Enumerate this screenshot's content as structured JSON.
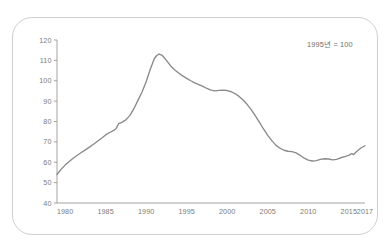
{
  "chart_data": {
    "type": "line",
    "title": "",
    "subtitle": "",
    "note": "1995년 = 100",
    "xlabel": "",
    "ylabel": "",
    "xlim": [
      1979,
      2017
    ],
    "ylim": [
      40,
      120
    ],
    "grid": false,
    "legend": null,
    "line_color": "#8a8a8a",
    "axis_color": "#9a9a9a",
    "frame_color": "#cfcfcf",
    "background_color": "#ffffff",
    "y_ticks": [
      40,
      50,
      60,
      70,
      80,
      90,
      100,
      110,
      120
    ],
    "y_tick_labels": [
      "40",
      "50",
      "60",
      "70",
      "80",
      "90",
      "100",
      "110",
      "120"
    ],
    "x_ticks": [
      1980,
      1985,
      1990,
      1995,
      2000,
      2005,
      2010,
      2015,
      2017
    ],
    "x_tick_labels": [
      "1980",
      "1985",
      "1990",
      "1995",
      "2000",
      "2005",
      "2010",
      "2015",
      "2017"
    ],
    "series": [
      {
        "name": "index",
        "x": [
          1979,
          1979.5,
          1980,
          1980.5,
          1981,
          1981.5,
          1982,
          1982.5,
          1983,
          1983.5,
          1984,
          1984.5,
          1985,
          1985.5,
          1986,
          1986.3,
          1986.6,
          1987,
          1987.5,
          1988,
          1988.5,
          1989,
          1989.5,
          1990,
          1990.5,
          1991,
          1991.3,
          1991.6,
          1992,
          1992.5,
          1993,
          1993.5,
          1994,
          1994.5,
          1995,
          1995.5,
          1996,
          1996.5,
          1997,
          1997.5,
          1998,
          1998.5,
          1999,
          1999.5,
          2000,
          2000.5,
          2001,
          2001.5,
          2002,
          2002.5,
          2003,
          2003.5,
          2004,
          2004.5,
          2005,
          2005.5,
          2006,
          2006.5,
          2007,
          2007.5,
          2008,
          2008.5,
          2009,
          2009.5,
          2010,
          2010.5,
          2011,
          2011.5,
          2012,
          2012.5,
          2013,
          2013.5,
          2014,
          2014.5,
          2015,
          2015.3,
          2015.6,
          2016,
          2016.5,
          2017
        ],
        "y": [
          54.0,
          56.5,
          58.6,
          60.4,
          62.0,
          63.4,
          64.8,
          66.1,
          67.4,
          68.8,
          70.3,
          71.8,
          73.4,
          74.6,
          75.6,
          76.6,
          78.9,
          79.6,
          80.8,
          83.0,
          86.4,
          90.5,
          94.6,
          99.5,
          105.5,
          110.8,
          112.4,
          113.1,
          112.4,
          110.0,
          107.4,
          105.4,
          103.8,
          102.4,
          101.2,
          100.0,
          99.0,
          98.1,
          97.2,
          96.2,
          95.4,
          95.0,
          95.3,
          95.4,
          95.2,
          94.6,
          93.6,
          92.2,
          90.4,
          88.2,
          85.6,
          82.6,
          79.4,
          76.2,
          73.2,
          70.6,
          68.4,
          66.9,
          65.9,
          65.4,
          65.2,
          64.6,
          63.4,
          62.0,
          61.0,
          60.6,
          60.8,
          61.4,
          61.7,
          61.6,
          61.2,
          61.4,
          62.2,
          62.8,
          63.4,
          64.2,
          63.8,
          65.4,
          67.0,
          68.1
        ]
      }
    ]
  }
}
